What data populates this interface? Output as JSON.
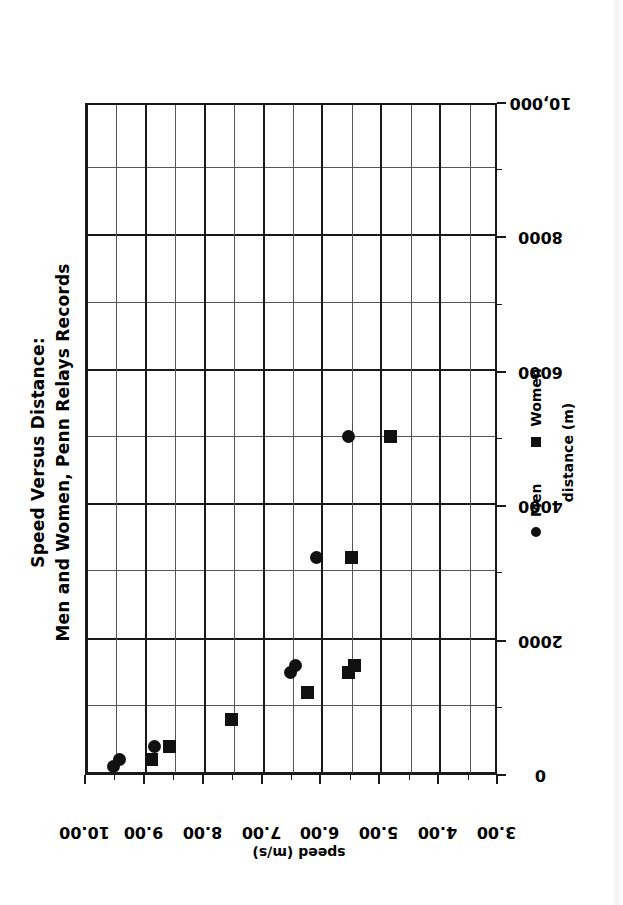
{
  "title": {
    "line1": "Speed Versus Distance:",
    "line2": "Men and Women, Penn Relays Records"
  },
  "axes": {
    "x_title": "distance (m)",
    "y_title": "speed (m/s)",
    "x_ticks": [
      "0",
      "2000",
      "4000",
      "6000",
      "8000",
      "10,000"
    ],
    "y_ticks": [
      "10.00",
      "9.00",
      "8.00",
      "7.00",
      "6.00",
      "5.00",
      "4.00",
      "3.00"
    ]
  },
  "legend": {
    "men_label": "Men",
    "women_label": "Women",
    "men_marker": "circle-marker",
    "women_marker": "square-marker"
  },
  "colors": {
    "marker": "#111111",
    "axis": "#1a1a1a",
    "gridline_minor": "#555555",
    "background": "#ffffff"
  },
  "chart_data": {
    "type": "scatter",
    "title": "Speed Versus Distance: Men and Women, Penn Relays Records",
    "xlabel": "distance (m)",
    "ylabel": "speed (m/s)",
    "xlim": [
      0,
      10000
    ],
    "ylim": [
      3.0,
      10.0
    ],
    "xticks": [
      0,
      2000,
      4000,
      6000,
      8000,
      10000
    ],
    "yticks": [
      3.0,
      4.0,
      5.0,
      6.0,
      7.0,
      8.0,
      9.0,
      10.0
    ],
    "x_minor_step": 1000,
    "y_minor_step": 0.5,
    "grid": true,
    "legend_position": "below-axis",
    "series": [
      {
        "name": "Men",
        "marker": "circle",
        "color": "#111111",
        "points": [
          {
            "x": 100,
            "y": 9.55
          },
          {
            "x": 200,
            "y": 9.45
          },
          {
            "x": 400,
            "y": 8.85
          },
          {
            "x": 800,
            "y": 7.55
          },
          {
            "x": 1500,
            "y": 6.55
          },
          {
            "x": 1600,
            "y": 6.45
          },
          {
            "x": 3200,
            "y": 6.1
          },
          {
            "x": 5000,
            "y": 5.55
          }
        ]
      },
      {
        "name": "Women",
        "marker": "square",
        "color": "#111111",
        "points": [
          {
            "x": 200,
            "y": 8.9
          },
          {
            "x": 400,
            "y": 8.6
          },
          {
            "x": 800,
            "y": 7.55
          },
          {
            "x": 1200,
            "y": 6.25
          },
          {
            "x": 1500,
            "y": 5.55
          },
          {
            "x": 1600,
            "y": 5.45
          },
          {
            "x": 3200,
            "y": 5.5
          },
          {
            "x": 5000,
            "y": 4.85
          }
        ]
      }
    ]
  }
}
